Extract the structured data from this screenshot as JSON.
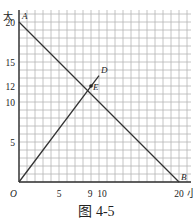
{
  "chart_data": {
    "type": "line",
    "title": "",
    "caption": "图 4-5",
    "xlabel": "小",
    "ylabel": "大",
    "xlim": [
      0,
      21.5
    ],
    "ylim": [
      0,
      21.5
    ],
    "grid": true,
    "x_ticks": [
      {
        "value": 5,
        "label": "5"
      },
      {
        "value": 9,
        "label": "9"
      },
      {
        "value": 10,
        "label": "10"
      },
      {
        "value": 20,
        "label": "20"
      }
    ],
    "y_ticks": [
      {
        "value": 5,
        "label": "5"
      },
      {
        "value": 10,
        "label": "10"
      },
      {
        "value": 12,
        "label": "12"
      },
      {
        "value": 15,
        "label": "15"
      },
      {
        "value": 20,
        "label": "20"
      }
    ],
    "origin_label": "O",
    "series": [
      {
        "name": "AB",
        "x": [
          0,
          20
        ],
        "y": [
          20,
          0
        ]
      },
      {
        "name": "OD",
        "x": [
          0,
          10
        ],
        "y": [
          0,
          13.3
        ]
      }
    ],
    "points": [
      {
        "label": "A",
        "x": 0,
        "y": 20
      },
      {
        "label": "B",
        "x": 20,
        "y": 0
      },
      {
        "label": "D",
        "x": 10,
        "y": 13.3
      },
      {
        "label": "E",
        "x": 9,
        "y": 12
      }
    ]
  },
  "labels": {
    "y_axis": "大",
    "x_axis": "小",
    "origin": "O",
    "caption": "图 4-5"
  }
}
